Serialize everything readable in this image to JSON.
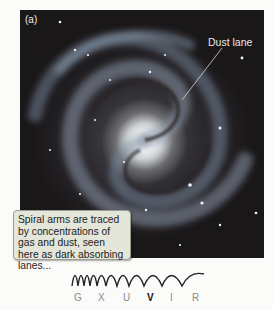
{
  "figure": {
    "panel_label": "(a)",
    "annotation": "Dust lane",
    "caption": "Spiral arms are traced by concentrations of gas and dust, seen here as dark absorbing lanes..."
  },
  "spectrum": {
    "bands": [
      {
        "label": "G",
        "active": false
      },
      {
        "label": "X",
        "active": false
      },
      {
        "label": "U",
        "active": false
      },
      {
        "label": "V",
        "active": true
      },
      {
        "label": "I",
        "active": false
      },
      {
        "label": "R",
        "active": false
      }
    ],
    "active_color": "#111111",
    "inactive_color": "#8a8a8a"
  }
}
